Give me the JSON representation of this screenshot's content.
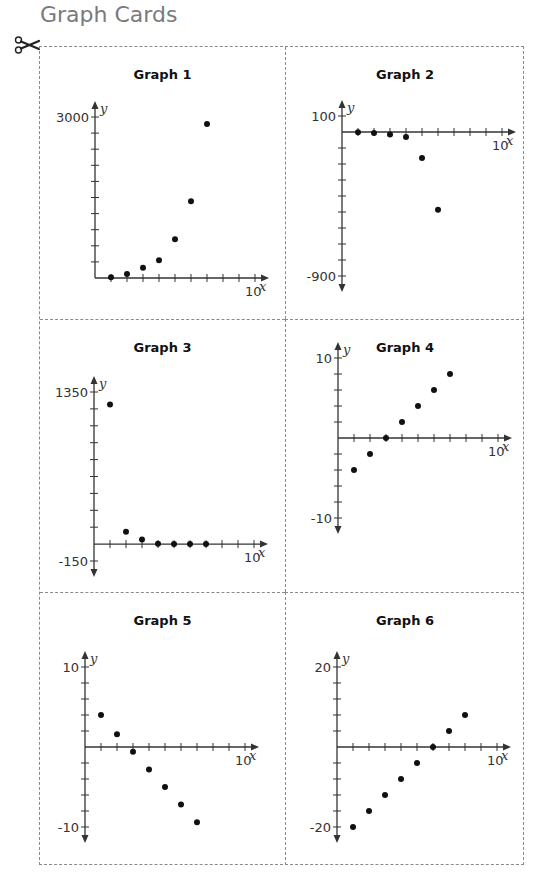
{
  "page": {
    "title": "Graph Cards",
    "cut_icon": "scissors-icon"
  },
  "colors": {
    "title": "#7a7a7a",
    "border": "#8a8a8a",
    "axis": "#333333",
    "point": "#111111"
  },
  "cards": [
    {
      "title": "Graph 1",
      "ymax_label": "3000",
      "ymin_label": "",
      "xmax_label": "10",
      "x_var": "x",
      "y_var": "y"
    },
    {
      "title": "Graph 2",
      "ymax_label": "100",
      "ymin_label": "-900",
      "xmax_label": "10",
      "x_var": "x",
      "y_var": "y"
    },
    {
      "title": "Graph 3",
      "ymax_label": "1350",
      "ymin_label": "-150",
      "xmax_label": "10",
      "x_var": "x",
      "y_var": "y"
    },
    {
      "title": "Graph 4",
      "ymax_label": "10",
      "ymin_label": "-10",
      "xmax_label": "10",
      "x_var": "x",
      "y_var": "y"
    },
    {
      "title": "Graph 5",
      "ymax_label": "10",
      "ymin_label": "-10",
      "xmax_label": "10",
      "x_var": "x",
      "y_var": "y"
    },
    {
      "title": "Graph 6",
      "ymax_label": "20",
      "ymin_label": "-20",
      "xmax_label": "10",
      "x_var": "x",
      "y_var": "y"
    }
  ],
  "chart_data": [
    {
      "type": "scatter",
      "title": "Graph 1",
      "xlabel": "x",
      "ylabel": "y",
      "xlim": [
        0,
        10
      ],
      "ylim": [
        0,
        3000
      ],
      "x_ticks_step": 1,
      "y_ticks_step": 300,
      "grid": false,
      "x": [
        1,
        2,
        3,
        4,
        5,
        6,
        7
      ],
      "y": [
        15,
        75,
        190,
        330,
        720,
        1430,
        2870
      ]
    },
    {
      "type": "scatter",
      "title": "Graph 2",
      "xlabel": "x",
      "ylabel": "y",
      "xlim": [
        0,
        10
      ],
      "ylim": [
        -900,
        100
      ],
      "x_ticks_step": 1,
      "y_ticks_step": 100,
      "grid": false,
      "x": [
        1,
        2,
        3,
        4,
        5,
        6
      ],
      "y": [
        -2,
        -6,
        -15,
        -31,
        -162,
        -486
      ]
    },
    {
      "type": "scatter",
      "title": "Graph 3",
      "xlabel": "x",
      "ylabel": "y",
      "xlim": [
        0,
        10
      ],
      "ylim": [
        -150,
        1350
      ],
      "x_ticks_step": 1,
      "y_ticks_step": 150,
      "grid": false,
      "x": [
        1,
        2,
        3,
        4,
        5,
        6,
        7
      ],
      "y": [
        1240,
        110,
        40,
        3,
        0,
        0,
        0
      ]
    },
    {
      "type": "scatter",
      "title": "Graph 4",
      "xlabel": "x",
      "ylabel": "y",
      "xlim": [
        0,
        10
      ],
      "ylim": [
        -10,
        10
      ],
      "x_ticks_step": 1,
      "y_ticks_step": 2,
      "grid": false,
      "x": [
        1,
        2,
        3,
        4,
        5,
        6,
        7
      ],
      "y": [
        -4,
        -2,
        0,
        2,
        4,
        6,
        8
      ]
    },
    {
      "type": "scatter",
      "title": "Graph 5",
      "xlabel": "x",
      "ylabel": "y",
      "xlim": [
        0,
        10
      ],
      "ylim": [
        -10,
        10
      ],
      "x_ticks_step": 1,
      "y_ticks_step": 2,
      "grid": false,
      "x": [
        1,
        2,
        3,
        4,
        5,
        6,
        7
      ],
      "y": [
        4,
        1.6,
        -0.6,
        -2.8,
        -5,
        -7.2,
        -9.4
      ]
    },
    {
      "type": "scatter",
      "title": "Graph 6",
      "xlabel": "x",
      "ylabel": "y",
      "xlim": [
        0,
        10
      ],
      "ylim": [
        -20,
        20
      ],
      "x_ticks_step": 1,
      "y_ticks_step": 4,
      "grid": false,
      "x": [
        1,
        2,
        3,
        4,
        5,
        6,
        7,
        8
      ],
      "y": [
        -20,
        -16,
        -12,
        -8,
        -4,
        0,
        4,
        8
      ]
    }
  ]
}
